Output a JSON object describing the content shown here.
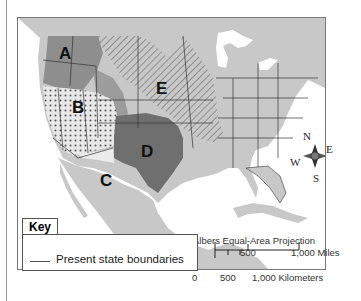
{
  "map": {
    "regions": [
      {
        "id": "A",
        "label": "A",
        "pattern": "solid-medium-gray"
      },
      {
        "id": "B",
        "label": "B",
        "pattern": "dotted"
      },
      {
        "id": "C",
        "label": "C",
        "pattern": "white-light"
      },
      {
        "id": "D",
        "label": "D",
        "pattern": "solid-dark-gray"
      },
      {
        "id": "E",
        "label": "E",
        "pattern": "diagonal-hatch"
      }
    ],
    "compass": {
      "n": "N",
      "e": "E",
      "s": "S",
      "w": "W"
    },
    "projection": "Albers Equal-Area Projection",
    "scale": {
      "miles": {
        "ticks": [
          "0",
          "500",
          "1,000 Miles"
        ]
      },
      "km": {
        "ticks": [
          "0",
          "500",
          "1,000 Kilometers"
        ]
      }
    },
    "colors": {
      "land": "#c8c8c8",
      "region_a": "#8e8e8e",
      "region_d": "#6f6f6f",
      "region_transition": "#9c9c9c",
      "hatch": "#a9a9a9",
      "water": "#ffffff",
      "border": "#333333"
    }
  },
  "key": {
    "title": "Key",
    "items": [
      {
        "symbol": "line",
        "label": "Present state boundaries"
      }
    ]
  }
}
